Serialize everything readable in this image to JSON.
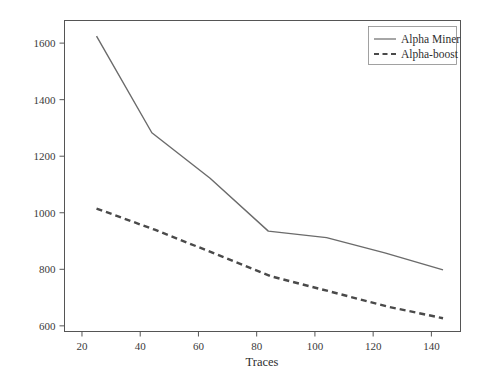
{
  "chart_data": {
    "type": "line",
    "title": "",
    "subtitle": "",
    "xlabel": "Traces",
    "ylabel": "",
    "xlim": [
      14,
      150
    ],
    "ylim": [
      580,
      1680
    ],
    "xticks": [
      20,
      40,
      60,
      80,
      100,
      120,
      140
    ],
    "xticklabels": [
      "20",
      "40",
      "60",
      "80",
      "100",
      "120",
      "140"
    ],
    "yticks": [
      600,
      800,
      1000,
      1200,
      1400,
      1600
    ],
    "yticklabels": [
      "600",
      "800",
      "1000",
      "1200",
      "1400",
      "1600"
    ],
    "grid": false,
    "legend_position": "upper right",
    "frame": true,
    "series": [
      {
        "name": "Alpha Miner",
        "style": "solid",
        "color": "#6b6b6b",
        "x": [
          25,
          44,
          64,
          84,
          104,
          124,
          144
        ],
        "values": [
          1625,
          1283,
          1122,
          935,
          912,
          858,
          798
        ]
      },
      {
        "name": "Alpha-boost",
        "style": "dashed",
        "color": "#4a4a4a",
        "x": [
          25,
          45,
          65,
          85,
          105,
          125,
          144
        ],
        "values": [
          1015,
          940,
          858,
          775,
          722,
          668,
          627
        ]
      }
    ]
  },
  "legend": {
    "entries": [
      {
        "label": "Alpha Miner",
        "style": "solid"
      },
      {
        "label": "Alpha-boost",
        "style": "dashed"
      }
    ]
  },
  "axes": {
    "x_title": "Traces",
    "y_title": ""
  },
  "colors": {
    "frame": "#555555",
    "series_solid": "#6b6b6b",
    "series_dashed": "#4a4a4a",
    "text": "#2e2e2e",
    "background": "#ffffff"
  }
}
